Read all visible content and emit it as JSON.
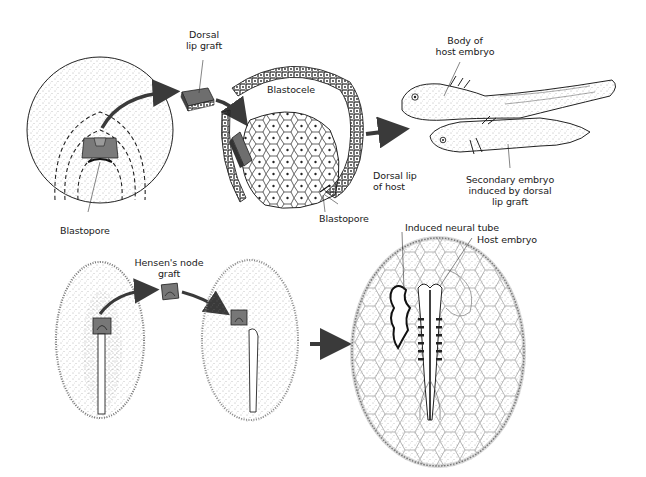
{
  "figure": {
    "top_panel": {
      "title": "Amphibian dorsal lip (organizer) graft",
      "labels": {
        "dorsal_lip_graft_1": "Dorsal",
        "dorsal_lip_graft_2": "lip graft",
        "blastocele": "Blastocele",
        "blastopore_left": "Blastopore",
        "dorsal_lip_host_1": "Dorsal lip",
        "dorsal_lip_host_2": "of host",
        "blastopore_mid": "Blastopore",
        "body_host_1": "Body of",
        "body_host_2": "host embryo",
        "secondary_1": "Secondary embryo",
        "secondary_2": "induced by dorsal",
        "secondary_3": "lip graft"
      }
    },
    "bottom_panel": {
      "title": "Chick Hensen's node graft",
      "labels": {
        "hensens_1": "Hensen's node",
        "hensens_2": "graft",
        "induced_neural_tube": "Induced neural tube",
        "host_embryo": "Host embryo"
      }
    },
    "colors": {
      "ink": "#1a1a1a",
      "graft_fill": "#7a7a7a",
      "arrow": "#3a3a3a",
      "stipple": "#555555",
      "background": "#ffffff"
    }
  }
}
